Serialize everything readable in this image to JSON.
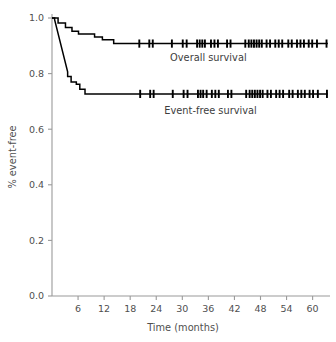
{
  "chart_data": {
    "type": "line",
    "title": "",
    "subtitle": "",
    "xlabel": "Time (months)",
    "ylabel": "% event-free",
    "xlim": [
      0,
      64
    ],
    "ylim": [
      0.0,
      1.0
    ],
    "grid": false,
    "legend_position": "inline-annotation",
    "x_ticks": [
      6,
      12,
      18,
      24,
      30,
      36,
      42,
      48,
      54,
      60
    ],
    "x_tick_labels": [
      "6",
      "12",
      "18",
      "24",
      "30",
      "36",
      "42",
      "48",
      "54",
      "60"
    ],
    "y_ticks": [
      0.0,
      0.2,
      0.4,
      0.6,
      0.8,
      1.0
    ],
    "y_tick_labels": [
      "0.0",
      "0.2",
      "0.4",
      "0.6",
      "0.8",
      "1.0"
    ],
    "series": [
      {
        "name": "Overall survival",
        "label": "Overall survival",
        "label_x": 36.0,
        "label_y": 0.845,
        "plateau_value": 0.908,
        "color": "#000000",
        "steps": [
          [
            0.0,
            1.0
          ],
          [
            1.4,
            1.0
          ],
          [
            1.4,
            0.982
          ],
          [
            3.1,
            0.982
          ],
          [
            3.1,
            0.966
          ],
          [
            4.6,
            0.966
          ],
          [
            4.6,
            0.952
          ],
          [
            6.1,
            0.952
          ],
          [
            6.1,
            0.942
          ],
          [
            9.8,
            0.942
          ],
          [
            9.8,
            0.932
          ],
          [
            11.6,
            0.932
          ],
          [
            11.6,
            0.922
          ],
          [
            14.2,
            0.922
          ],
          [
            14.2,
            0.908
          ],
          [
            63.5,
            0.908
          ]
        ],
        "censor_times": [
          20.1,
          22.4,
          23.2,
          27.6,
          30.1,
          31.0,
          33.4,
          34.0,
          34.6,
          35.2,
          36.6,
          37.4,
          38.2,
          40.3,
          41.1,
          44.5,
          45.3,
          45.9,
          46.5,
          47.1,
          47.7,
          48.3,
          49.4,
          50.2,
          51.4,
          52.2,
          53.0,
          54.4,
          55.2,
          56.4,
          57.2,
          58.0,
          59.1,
          59.9,
          61.0,
          63.2
        ]
      },
      {
        "name": "Event-free survival",
        "label": "Event-free survival",
        "label_x": 36.5,
        "label_y": 0.655,
        "plateau_value": 0.727,
        "color": "#000000",
        "steps": [
          [
            0.0,
            1.0
          ],
          [
            0.6,
            1.0
          ],
          [
            0.6,
            0.994
          ],
          [
            3.6,
            0.806
          ],
          [
            3.6,
            0.79
          ],
          [
            4.4,
            0.79
          ],
          [
            4.4,
            0.77
          ],
          [
            5.6,
            0.77
          ],
          [
            5.6,
            0.762
          ],
          [
            6.4,
            0.762
          ],
          [
            6.4,
            0.744
          ],
          [
            7.6,
            0.744
          ],
          [
            7.6,
            0.727
          ],
          [
            63.5,
            0.727
          ]
        ],
        "censor_times": [
          20.3,
          22.6,
          23.4,
          27.8,
          30.3,
          31.2,
          33.6,
          34.2,
          34.8,
          35.6,
          36.8,
          37.6,
          38.4,
          40.5,
          41.3,
          44.7,
          45.5,
          46.1,
          46.7,
          47.3,
          47.9,
          48.5,
          49.6,
          50.4,
          51.6,
          52.4,
          53.2,
          54.6,
          55.4,
          56.6,
          57.4,
          58.2,
          59.3,
          60.1,
          61.2,
          63.3
        ]
      }
    ]
  },
  "axes": {
    "x_axis_title": "Time (months)",
    "y_axis_title": "% event-free"
  },
  "colors": {
    "curve": "#000000",
    "axis": "#9a9a9a",
    "text": "#4f4f4f",
    "background": "#ffffff"
  }
}
